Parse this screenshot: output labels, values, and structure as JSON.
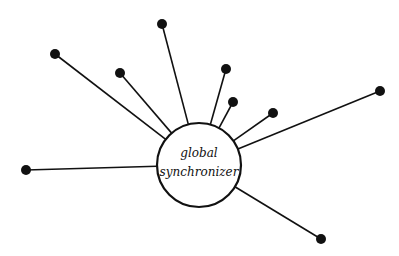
{
  "diagram": {
    "hub": {
      "label_line1": "global",
      "label_line2": "synchronizer",
      "cx": 199,
      "cy": 165,
      "r": 42
    },
    "nodes": [
      {
        "id": "n1",
        "x": 55,
        "y": 54
      },
      {
        "id": "n2",
        "x": 120,
        "y": 73
      },
      {
        "id": "n3",
        "x": 162,
        "y": 24
      },
      {
        "id": "n4",
        "x": 226,
        "y": 69
      },
      {
        "id": "n5",
        "x": 233,
        "y": 102
      },
      {
        "id": "n6",
        "x": 273,
        "y": 113
      },
      {
        "id": "n7",
        "x": 380,
        "y": 91
      },
      {
        "id": "n8",
        "x": 26,
        "y": 170
      },
      {
        "id": "n9",
        "x": 321,
        "y": 239
      }
    ],
    "colors": {
      "line": "#111111",
      "node": "#111111",
      "background": "#ffffff"
    }
  }
}
